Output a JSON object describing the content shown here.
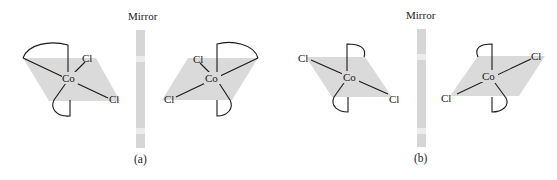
{
  "figure": {
    "panels": [
      {
        "id": "a",
        "caption": "(a)",
        "mirror_label": "Mirror",
        "left_molecule": {
          "center": "Co",
          "ligands": [
            "Cl",
            "Cl"
          ],
          "chelate_rings": 2
        },
        "right_molecule": {
          "center": "Co",
          "ligands": [
            "Cl",
            "Cl"
          ],
          "chelate_rings": 2
        }
      },
      {
        "id": "b",
        "caption": "(b)",
        "mirror_label": "Mirror",
        "left_molecule": {
          "center": "Co",
          "ligands": [
            "Cl",
            "Cl"
          ],
          "chelate_rings": 2
        },
        "right_molecule": {
          "center": "Co",
          "ligands": [
            "Cl",
            "Cl"
          ],
          "chelate_rings": 2
        }
      }
    ]
  },
  "colors": {
    "plane": "#dadada",
    "mirror": "#d6d6d6",
    "line": "#1a1a1a",
    "background": "#ffffff"
  }
}
